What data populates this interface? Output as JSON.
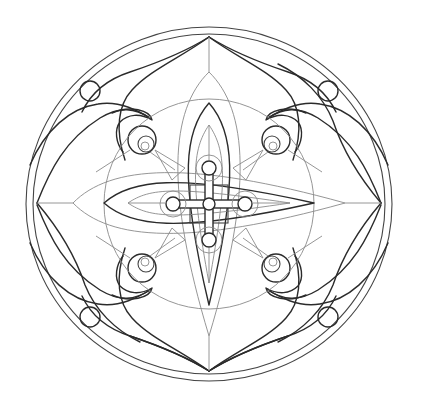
{
  "image": {
    "title": "Mandala coloring page",
    "description": "Black-and-white line-art mandala with four-fold symmetry inside a double circle",
    "colors": {
      "background": "#ffffff",
      "ink_dark": "#2b2b2b",
      "ink_light": "#8a8a8a"
    },
    "elements": {
      "outer_border": "double circle",
      "outer_petals": 4,
      "corner_rings": 4,
      "spiral_scrolls": 4,
      "lens_petals": 4,
      "center": "cross with five small rings"
    }
  }
}
